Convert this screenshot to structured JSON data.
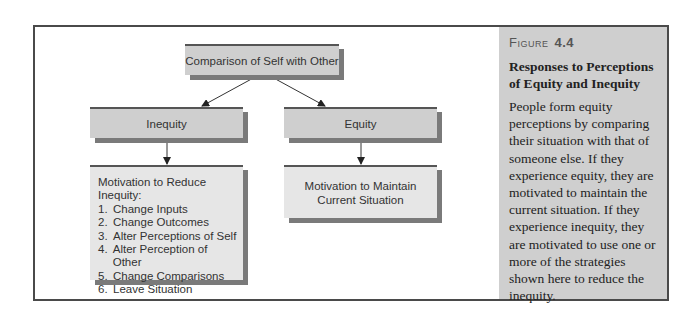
{
  "diagram": {
    "root": {
      "label": "Comparison of Self with Other"
    },
    "branches": [
      {
        "label": "Inequity"
      },
      {
        "label": "Equity"
      }
    ],
    "inequity_outcome": {
      "heading": "Motivation to Reduce Inequity:",
      "items": [
        {
          "num": "1.",
          "label": "Change Inputs"
        },
        {
          "num": "2.",
          "label": "Change Outcomes"
        },
        {
          "num": "3.",
          "label": "Alter Perceptions of Self"
        },
        {
          "num": "4.",
          "label": "Alter Perception of Other"
        },
        {
          "num": "5.",
          "label": "Change Comparisons"
        },
        {
          "num": "6.",
          "label": "Leave Situation"
        }
      ]
    },
    "equity_outcome": {
      "line1": "Motivation to Maintain",
      "line2": "Current Situation"
    }
  },
  "caption": {
    "figure_word": "Figure",
    "figure_number": "4.4",
    "title": "Responses to Perceptions of Equity and Inequity",
    "body": "People form equity perceptions by comparing their situation with that of someone else. If they experience equity, they are motivated to maintain the current situation. If they experience inequity, they are motivated to use one or more of the strategies shown here to reduce the inequity."
  },
  "colors": {
    "box_fill": "#cfcfcf",
    "box_light_fill": "#e6e6e6",
    "shadow": "#7a7a7a",
    "frame": "#4a4a4a",
    "sidebar": "#cfcfcf"
  }
}
